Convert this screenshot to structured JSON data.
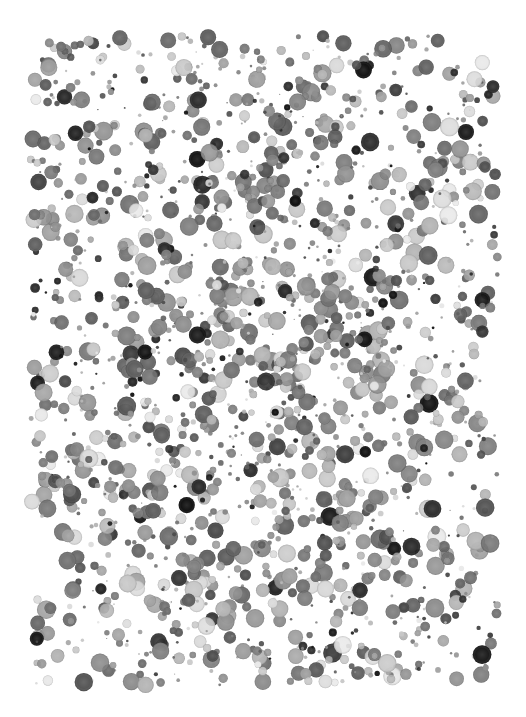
{
  "canvas": {
    "width": 526,
    "height": 717,
    "background": "#ffffff"
  },
  "artwork": {
    "description": "Field of scattered grayscale dots, denser toward the center",
    "dot_count": 1900,
    "region": {
      "x0": 30,
      "y0": 35,
      "x1": 498,
      "y1": 685
    },
    "radius_range": [
      1.2,
      9.5
    ],
    "gray_palette": [
      "#111111",
      "#2a2a2a",
      "#4a4a4a",
      "#5e5e5e",
      "#6f6f6f",
      "#808080",
      "#8f8f8f",
      "#a0a0a0",
      "#b5b5b5",
      "#c8c8c8",
      "#dadada",
      "#e8e8e8"
    ],
    "palette_weights": [
      0.05,
      0.05,
      0.08,
      0.1,
      0.12,
      0.13,
      0.12,
      0.11,
      0.09,
      0.07,
      0.05,
      0.03
    ],
    "center_density_bias": 0.55,
    "seed": 20240517
  }
}
